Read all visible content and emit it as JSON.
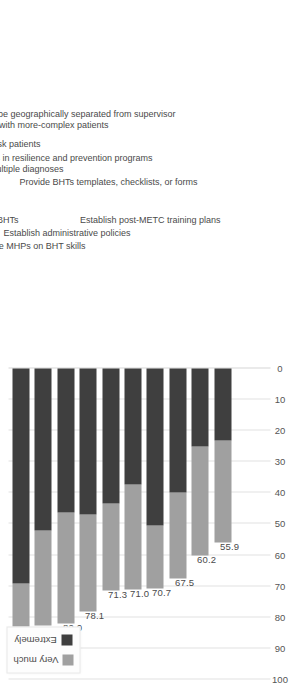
{
  "chart_data": {
    "type": "bar",
    "orientation": "horizontal-stacked",
    "title": "",
    "subtitle": "",
    "xlabel": "",
    "ylabel": "",
    "xlim": [
      0,
      100
    ],
    "xticks": [
      0,
      10,
      20,
      30,
      40,
      50,
      60,
      70,
      80,
      90,
      100
    ],
    "grid": true,
    "legend_position": "top-right",
    "stacked": true,
    "categories": [
      "Professional development for BHTs",
      "Train BHTs to implement EBPs with lower-risk patients",
      "Train BHTs on treatments for multiple diagnoses",
      "Educate MHPs on BHT skills",
      "Train BHTs to implement EBPs with more-complex patients",
      "Establish administrative policies",
      "Certify BHTs in resilience and prevention programs",
      "Prepare BHTs to be geographically separated from supervisor",
      "Provide BHTs templates, checklists, or forms",
      "Establish post-METC training plans"
    ],
    "series": [
      {
        "name": "Extremely",
        "color": "#3f3f3f",
        "values": [
          69.0,
          52.2,
          46.4,
          46.9,
          43.5,
          37.4,
          50.6,
          40.0,
          25.1,
          23.3
        ]
      },
      {
        "name": "Very much",
        "color": "#a0a0a0",
        "values": [
          21.4,
          30.4,
          35.6,
          31.2,
          27.8,
          33.6,
          20.1,
          27.5,
          35.1,
          32.6
        ]
      }
    ],
    "totals": [
      90.4,
      82.6,
      82.0,
      78.1,
      71.3,
      71.0,
      70.7,
      67.5,
      60.2,
      55.9
    ],
    "total_labels": [
      "90.4",
      "82.6",
      "82.0",
      "78.1",
      "71.3",
      "71.0",
      "70.7",
      "67.5",
      "60.2",
      "55.9"
    ],
    "tick_labels": [
      "0",
      "10",
      "20",
      "30",
      "40",
      "50",
      "60",
      "70",
      "80",
      "90",
      "100"
    ]
  },
  "legend": {
    "items": [
      {
        "label": "Extremely",
        "color": "#3f3f3f",
        "swatch": "legend-swatch-extremely"
      },
      {
        "label": "Very much",
        "color": "#a0a0a0",
        "swatch": "legend-swatch-very-much"
      }
    ]
  },
  "colors": {
    "extremely": "#3f3f3f",
    "very_much": "#a0a0a0",
    "gridline": "#e2e2e2",
    "text": "#4a4a4a",
    "background": "#ffffff"
  }
}
